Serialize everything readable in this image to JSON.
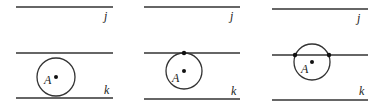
{
  "diagram": {
    "panels": [
      {
        "id": "panel-1",
        "line_j": {
          "x1": 16,
          "x2": 113,
          "y": 7,
          "label": "j",
          "label_x": 104,
          "label_y": 20
        },
        "line_mid": {
          "x1": 16,
          "x2": 113,
          "y": 53
        },
        "line_k": {
          "x1": 16,
          "x2": 113,
          "y": 98,
          "label": "k",
          "label_x": 104,
          "label_y": 94
        },
        "circle": {
          "cx": 56,
          "cy": 77,
          "r": 19
        },
        "center_label": "A",
        "center_label_x": 44,
        "center_label_y": 84,
        "intersection_points": []
      },
      {
        "id": "panel-2",
        "line_j": {
          "x1": 144,
          "x2": 240,
          "y": 7,
          "label": "j",
          "label_x": 230,
          "label_y": 20
        },
        "line_mid": {
          "x1": 144,
          "x2": 240,
          "y": 53
        },
        "line_k": {
          "x1": 144,
          "x2": 240,
          "y": 99,
          "label": "k",
          "label_x": 231,
          "label_y": 95
        },
        "circle": {
          "cx": 184,
          "cy": 71,
          "r": 18
        },
        "center_label": "A",
        "center_label_x": 172,
        "center_label_y": 82,
        "intersection_points": [
          {
            "x": 184,
            "y": 53
          }
        ]
      },
      {
        "id": "panel-3",
        "line_j": {
          "x1": 272,
          "x2": 368,
          "y": 9,
          "label": "j",
          "label_x": 357,
          "label_y": 22
        },
        "line_mid": {
          "x1": 272,
          "x2": 368,
          "y": 55
        },
        "line_k": {
          "x1": 272,
          "x2": 368,
          "y": 100,
          "label": "k",
          "label_x": 359,
          "label_y": 95
        },
        "circle": {
          "cx": 312,
          "cy": 62,
          "r": 18
        },
        "center_label": "A",
        "center_label_x": 301,
        "center_label_y": 73,
        "intersection_points": [
          {
            "x": 295,
            "y": 55
          },
          {
            "x": 329,
            "y": 55
          }
        ]
      }
    ],
    "colors": {
      "stroke": "#333333",
      "point": "#111111"
    }
  }
}
